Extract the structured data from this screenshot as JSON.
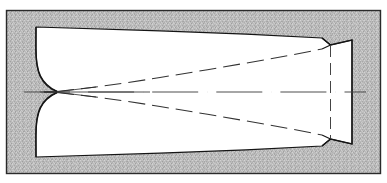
{
  "figure": {
    "caption_artifact": "",
    "background_label": "hatched-texture-field",
    "frame_label": "figure-border"
  },
  "colors": {
    "page": "#ffffff",
    "texture_base": "#b9b9b9",
    "texture_speckle_light": "#d8d8d8",
    "texture_speckle_dark": "#949494",
    "frame_line": "#2a2a2a",
    "nozzle_fill": "#ffffff",
    "nozzle_outline": "#1a1a1a",
    "dashed_line": "#3a3a3a",
    "centerline": "#4a4a4a"
  },
  "geometry": {
    "canvas": {
      "width": 387,
      "height": 183
    },
    "frame": {
      "x": 6,
      "y": 10,
      "width": 375,
      "height": 164
    },
    "axis_y": 92,
    "throat": {
      "x": 57,
      "y": 92
    },
    "inlet_x": 36,
    "exit_flange_x": 352,
    "nozzle_outline_path": "M 36 27 L 36 27 C 36 27 36 27 36 27 L 160 31 L 240 34 L 322 38 L 330 45 L 352 40 L 352 144 L 330 139 L 322 146 L 240 150 L 160 153 L 36 157 L 36 157 C 36 157 36 157 36 157 Z",
    "upper_wall_path": "M 36 27 L 155 30.5 L 245 34 L 322 38",
    "lower_wall_path": "M 36 157 L 155 153.5 L 245 150 L 322 146",
    "convergent_upper_path": "M 36 27 C 36 60 40 78 57 91",
    "convergent_lower_path": "M 36 157 C 36 124 40 106 57 93",
    "divergent_upper_path": "M 57 91 C 100 86 120 82 160 76 C 220 67 280 58 322 49",
    "divergent_lower_path": "M 57 93 C 100 98 120 102 160 108 C 220 117 280 126 322 135",
    "exit_notch_upper": "M 322 38 L 330 45 L 352 40",
    "exit_notch_lower": "M 322 146 L 330 139 L 352 144",
    "exit_inner_upper": "M 322 49 L 330 45",
    "exit_inner_lower": "M 322 135 L 330 139",
    "exit_dashed_vertical_x": 330,
    "exit_dashed_vertical_y1": 45,
    "exit_dashed_vertical_y2": 139,
    "centerline_x1": 24,
    "centerline_x2": 366
  },
  "annotations": {
    "upper_streamline_label": "upper-flow-boundary",
    "lower_streamline_label": "lower-flow-boundary",
    "centerline_label": "nozzle-axis-centerline",
    "throat_label": "nozzle-throat",
    "exit_label": "nozzle-exit-flange",
    "inlet_label": "nozzle-inlet"
  }
}
